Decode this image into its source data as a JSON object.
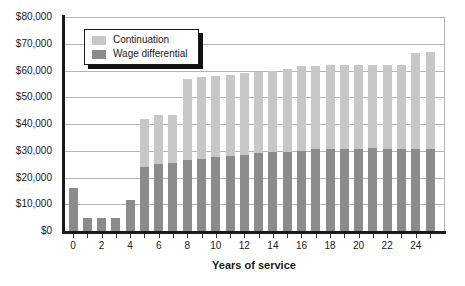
{
  "chart_data": {
    "type": "bar",
    "stacked": true,
    "xlabel": "Years of service",
    "ylabel": "",
    "ylim": [
      0,
      80000
    ],
    "grid": "horizontal",
    "legend_position": "top-left",
    "x": [
      0,
      1,
      2,
      3,
      4,
      5,
      6,
      7,
      8,
      9,
      10,
      11,
      12,
      13,
      14,
      15,
      16,
      17,
      18,
      19,
      20,
      21,
      22,
      23,
      24,
      25
    ],
    "x_tick_label_every": 2,
    "y_tick_labels": [
      "$0",
      "$10,000",
      "$20,000",
      "$30,000",
      "$40,000",
      "$50,000",
      "$60,000",
      "$70,000",
      "$80,000"
    ],
    "series": [
      {
        "name": "Wage differential",
        "color": "#8b8b8b",
        "values": [
          16000,
          5000,
          5000,
          5000,
          11500,
          24000,
          25000,
          25500,
          26500,
          27000,
          27500,
          28000,
          28500,
          29000,
          29500,
          29500,
          30000,
          30500,
          30500,
          30500,
          30500,
          31000,
          30500,
          30500,
          30500,
          30500
        ]
      },
      {
        "name": "Continuation",
        "color": "#c7c7c7",
        "values": [
          0,
          0,
          0,
          0,
          0,
          18000,
          18500,
          18000,
          30500,
          30500,
          30500,
          30500,
          30500,
          30500,
          30500,
          31000,
          31500,
          31000,
          31500,
          31500,
          31500,
          31000,
          31500,
          31500,
          36000,
          36500
        ]
      }
    ]
  },
  "legend": {
    "items": [
      {
        "label": "Continuation",
        "color": "#c7c7c7"
      },
      {
        "label": "Wage differential",
        "color": "#8b8b8b"
      }
    ]
  },
  "colors": {
    "continuation": "#c7c7c7",
    "wage_differential": "#8b8b8b",
    "gridline": "#b3b3b3",
    "axis": "#1a1a1a",
    "background": "#ffffff"
  }
}
